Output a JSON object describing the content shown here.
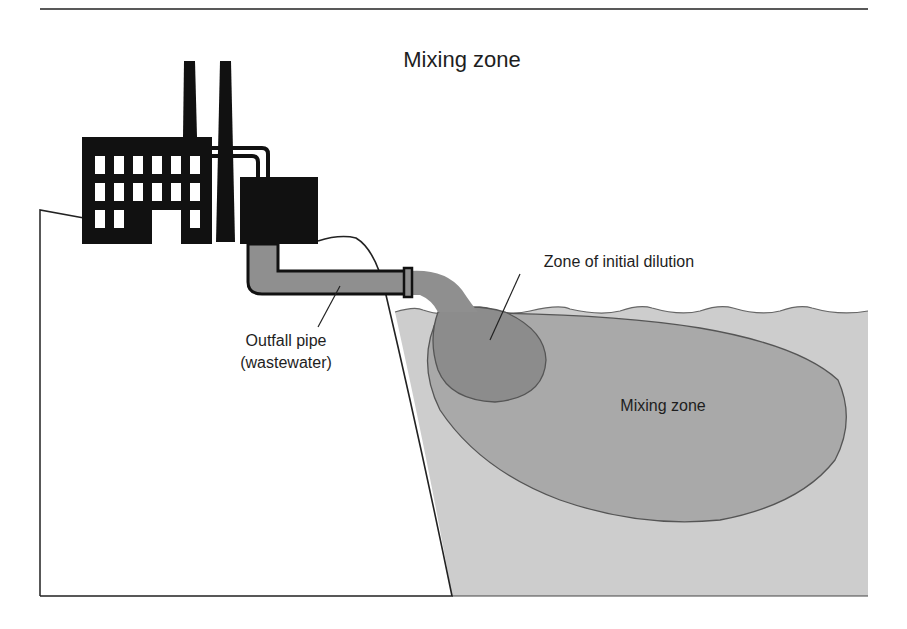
{
  "figure": {
    "title": "Mixing zone",
    "labels": {
      "outfall_line1": "Outfall pipe",
      "outfall_line2": "(wastewater)",
      "initial_dilution": "Zone of initial dilution",
      "mixing_zone": "Mixing zone"
    },
    "components": [
      "factory",
      "smokestacks",
      "treatment-tank",
      "outfall-pipe",
      "shoreline-land",
      "water-body",
      "zone-of-initial-dilution",
      "mixing-zone"
    ],
    "colors": {
      "ink": "#111111",
      "pipe": "#8f8f8f",
      "water": "#cdcdcd",
      "mixing_zone": "#a9a9a9",
      "initial_dilution": "#8c8c8c",
      "outline": "#555555"
    }
  }
}
